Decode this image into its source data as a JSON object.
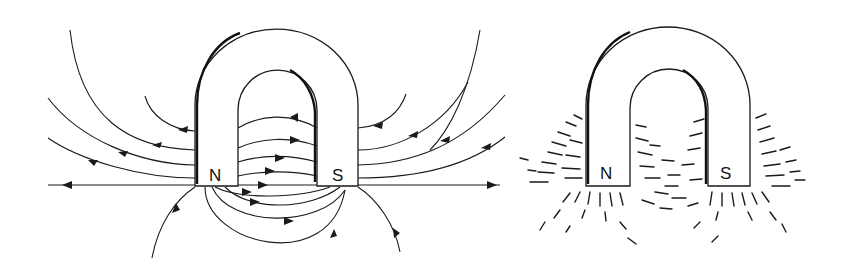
{
  "figure": {
    "panels": [
      {
        "id": "field-lines",
        "description": "Horseshoe magnet with magnetic field lines and direction arrows",
        "labels": {
          "north": "N",
          "south": "S"
        }
      },
      {
        "id": "iron-filings",
        "description": "Horseshoe magnet with iron filings pattern",
        "labels": {
          "north": "N",
          "south": "S"
        }
      }
    ],
    "colors": {
      "ink": "#1a1a1a",
      "background": "#ffffff"
    }
  }
}
